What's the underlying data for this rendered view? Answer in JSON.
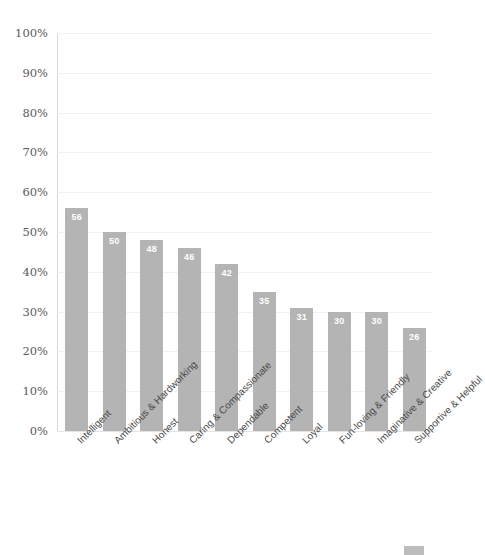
{
  "chart_data": {
    "type": "bar",
    "title": "",
    "xlabel": "",
    "ylabel": "",
    "ylim": [
      0,
      100
    ],
    "yticks": [
      "0%",
      "10%",
      "20%",
      "30%",
      "40%",
      "50%",
      "60%",
      "70%",
      "80%",
      "90%",
      "100%"
    ],
    "ytick_values": [
      0,
      10,
      20,
      30,
      40,
      50,
      60,
      70,
      80,
      90,
      100
    ],
    "grid": true,
    "grid_axis": "y",
    "legend_position": "bottom-right",
    "bar_color": "#b4b4b4",
    "label_color": "#ffffff",
    "categories": [
      "Intelligent",
      "Ambitious & Hardworking",
      "Honest",
      "Caring & Compassionate",
      "Dependable",
      "Competent",
      "Loyal",
      "Fun-loving & Friendly",
      "Imaginative & Creative",
      "Supportive & Helpful"
    ],
    "values": [
      56,
      50,
      48,
      46,
      42,
      35,
      31,
      30,
      30,
      26
    ],
    "value_labels": [
      "56",
      "50",
      "48",
      "46",
      "42",
      "35",
      "31",
      "30",
      "30",
      "26"
    ]
  },
  "legend": {
    "entries": [
      {
        "label": "",
        "color": "#bdbdbd"
      }
    ]
  }
}
